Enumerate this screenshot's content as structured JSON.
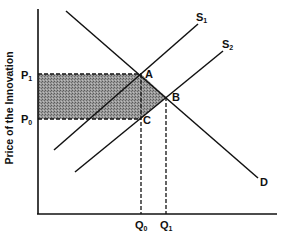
{
  "diagram": {
    "type": "supply-demand",
    "y_axis_label": "Price of the Innovation",
    "x_axis_label": "",
    "price_levels": [
      {
        "id": "P1",
        "main": "P",
        "sub": "1",
        "y": 74
      },
      {
        "id": "P0",
        "main": "P",
        "sub": "0",
        "y": 119
      }
    ],
    "quantity_levels": [
      {
        "id": "Q0",
        "main": "Q",
        "sub": "0",
        "x": 141
      },
      {
        "id": "Q1",
        "main": "Q",
        "sub": "1",
        "x": 166
      }
    ],
    "curves": [
      {
        "id": "S1",
        "main": "S",
        "sub": "1",
        "kind": "supply",
        "from": [
          54,
          150
        ],
        "to": [
          198,
          24
        ]
      },
      {
        "id": "S2",
        "main": "S",
        "sub": "2",
        "kind": "supply",
        "from": [
          75,
          172
        ],
        "to": [
          223,
          51
        ]
      },
      {
        "id": "D",
        "main": "D",
        "sub": "",
        "kind": "demand",
        "from": [
          66,
          11
        ],
        "to": [
          258,
          178
        ]
      }
    ],
    "points": [
      {
        "id": "A",
        "label": "A",
        "x": 141,
        "y": 74
      },
      {
        "id": "B",
        "label": "B",
        "x": 166,
        "y": 97
      },
      {
        "id": "C",
        "label": "C",
        "x": 141,
        "y": 119
      }
    ],
    "shaded_region": "Area between P1 and P0 from the price axis to A–C, plus triangle A–B–C",
    "colors": {
      "line": "#111111",
      "shade": "#8a8a8a",
      "background": "#ffffff"
    }
  }
}
